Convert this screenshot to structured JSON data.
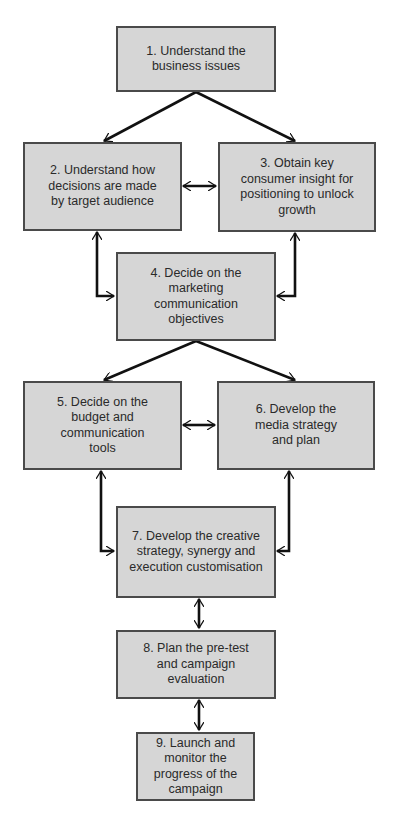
{
  "diagram": {
    "type": "flowchart",
    "steps": [
      {
        "id": 1,
        "label": "1. Understand the business issues"
      },
      {
        "id": 2,
        "label": "2. Understand how decisions are made by target audience"
      },
      {
        "id": 3,
        "label": "3. Obtain key consumer insight for positioning to unlock growth"
      },
      {
        "id": 4,
        "label": "4. Decide on the marketing communication objectives"
      },
      {
        "id": 5,
        "label": "5. Decide on the budget and communication tools"
      },
      {
        "id": 6,
        "label": "6. Develop the media strategy and plan"
      },
      {
        "id": 7,
        "label": "7. Develop the creative strategy, synergy and execution customisation"
      },
      {
        "id": 8,
        "label": "8. Plan the pre-test and campaign evaluation"
      },
      {
        "id": 9,
        "label": "9. Launch and monitor the progress of the campaign"
      }
    ],
    "connections": [
      {
        "from": 1,
        "to": 2,
        "type": "one-way"
      },
      {
        "from": 1,
        "to": 3,
        "type": "one-way"
      },
      {
        "from": 2,
        "to": 3,
        "type": "two-way"
      },
      {
        "from": 2,
        "to": 4,
        "type": "two-way"
      },
      {
        "from": 3,
        "to": 4,
        "type": "two-way"
      },
      {
        "from": 4,
        "to": 5,
        "type": "one-way"
      },
      {
        "from": 4,
        "to": 6,
        "type": "one-way"
      },
      {
        "from": 5,
        "to": 6,
        "type": "two-way"
      },
      {
        "from": 5,
        "to": 7,
        "type": "two-way"
      },
      {
        "from": 6,
        "to": 7,
        "type": "two-way"
      },
      {
        "from": 7,
        "to": 8,
        "type": "two-way"
      },
      {
        "from": 8,
        "to": 9,
        "type": "two-way"
      }
    ],
    "colors": {
      "box_fill": "#d6d6d6",
      "box_border": "#4a4a4a",
      "arrow": "#111111"
    }
  }
}
